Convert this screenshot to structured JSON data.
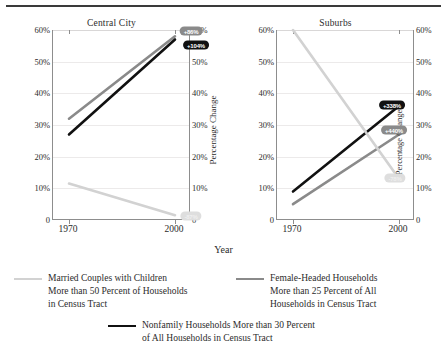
{
  "chart_data": {
    "type": "line",
    "title": "",
    "xlabel": "Year",
    "ylabel": "Percentage",
    "ylabel_right": "Percentage Change",
    "x": [
      "1970",
      "2000"
    ],
    "ylim": [
      0,
      60
    ],
    "yticks": [
      "0",
      "10%",
      "20%",
      "30%",
      "40%",
      "50%",
      "60%"
    ],
    "yticks_right": [
      "0",
      "10%",
      "20%",
      "30%",
      "40%",
      "50%",
      "60%"
    ],
    "grid": true,
    "legend_position": "bottom",
    "panels": [
      {
        "title": "Central City",
        "series": [
          {
            "name": "Female-Headed Households More than 25 Percent of All Households in Census Tract",
            "color": "#8a8a8a",
            "values": [
              32,
              58
            ],
            "change_label": "+86%",
            "badge_style": "gray"
          },
          {
            "name": "Nonfamily Households More than 30 Percent of All Households in Census Tract",
            "color": "#111111",
            "values": [
              27,
              57
            ],
            "change_label": "+104%",
            "badge_style": "black"
          },
          {
            "name": "Married Couples with Children More than 50 Percent of Households in Census Tract",
            "color": "#d2d2d2",
            "values": [
              11.5,
              1.5
            ],
            "change_label": "-87%",
            "badge_style": "light"
          }
        ]
      },
      {
        "title": "Suburbs",
        "series": [
          {
            "name": "Nonfamily Households More than 30 Percent of All Households in Census Tract",
            "color": "#111111",
            "values": [
              9,
              36
            ],
            "change_label": "+338%",
            "badge_style": "black"
          },
          {
            "name": "Female-Headed Households More than 25 Percent of All Households in Census Tract",
            "color": "#8a8a8a",
            "values": [
              5,
              27
            ],
            "change_label": "+440%",
            "badge_style": "gray"
          },
          {
            "name": "Married Couples with Children More than 50 Percent of Households in Census Tract",
            "color": "#d2d2d2",
            "values": [
              60,
              13
            ],
            "change_label": "-78%",
            "badge_style": "light"
          }
        ]
      }
    ],
    "legend": [
      {
        "color": "#d2d2d2",
        "lines": [
          "Married Couples with Children",
          "More than 50 Percent of Households",
          "in Census Tract"
        ]
      },
      {
        "color": "#8a8a8a",
        "lines": [
          "Female-Headed Households",
          "More than 25 Percent of All",
          "Households in Census Tract"
        ]
      },
      {
        "color": "#111111",
        "lines": [
          "Nonfamily Households More than 30 Percent",
          "of All Households in Census Tract"
        ]
      }
    ]
  }
}
